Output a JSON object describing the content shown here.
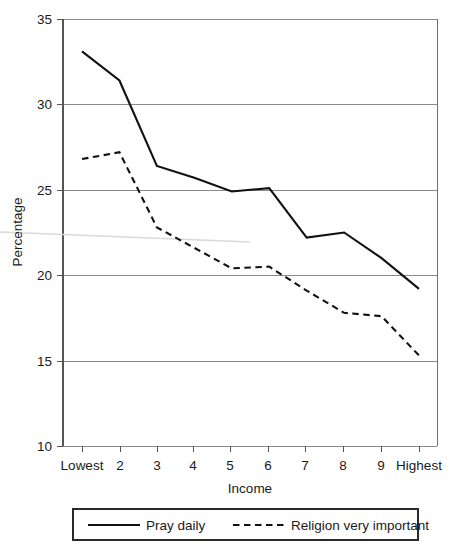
{
  "chart_data": {
    "type": "line",
    "title": "",
    "xlabel": "Income",
    "ylabel": "Percentage",
    "categories": [
      "Lowest",
      "2",
      "3",
      "4",
      "5",
      "6",
      "7",
      "8",
      "9",
      "Highest"
    ],
    "ylim": [
      10,
      35
    ],
    "yticks": [
      10,
      15,
      20,
      25,
      30,
      35
    ],
    "ytick_labels": [
      "10",
      "15",
      "20",
      "25",
      "30",
      "35"
    ],
    "grid": true,
    "grid_axis": "y",
    "legend_position": "below-plot",
    "series": [
      {
        "name": "Pray daily",
        "style": "solid",
        "color": "#111111",
        "values": [
          33.1,
          31.4,
          26.4,
          25.7,
          24.9,
          25.1,
          22.2,
          22.5,
          21.0,
          19.2
        ]
      },
      {
        "name": "Religion very important",
        "style": "dashed",
        "color": "#111111",
        "values": [
          26.8,
          27.2,
          22.8,
          21.6,
          20.4,
          20.5,
          19.1,
          17.8,
          17.6,
          15.3
        ]
      }
    ]
  },
  "axes": {
    "y_axis_label": "Percentage",
    "x_axis_label": "Income"
  },
  "legend": {
    "items": [
      {
        "label": "Pray daily",
        "style": "solid"
      },
      {
        "label": "Religion very important",
        "style": "dashed"
      }
    ]
  },
  "colors": {
    "line": "#111111",
    "grid": "#8a8a8a",
    "frame": "#6f6f6f",
    "background": "#ffffff"
  }
}
